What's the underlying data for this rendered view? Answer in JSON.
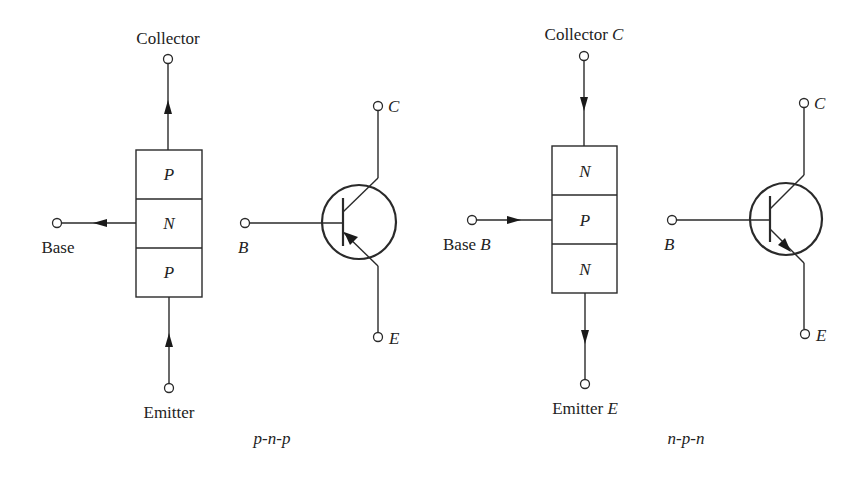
{
  "figure": {
    "pnp": {
      "caption": "p-n-p",
      "block": {
        "collector_label": "Collector",
        "base_label": "Base",
        "emitter_label": "Emitter",
        "layers": [
          "P",
          "N",
          "P"
        ]
      },
      "symbol": {
        "collector_label": "C",
        "base_label": "B",
        "emitter_label": "E"
      }
    },
    "npn": {
      "caption": "n-p-n",
      "block": {
        "collector_label": "Collector",
        "collector_symbol": "C",
        "base_label": "Base",
        "base_symbol": "B",
        "emitter_label": "Emitter",
        "emitter_symbol": "E",
        "layers": [
          "N",
          "P",
          "N"
        ]
      },
      "symbol": {
        "collector_label": "C",
        "base_label": "B",
        "emitter_label": "E"
      }
    }
  },
  "colors": {
    "line": "#2a2a2a",
    "text": "#222222",
    "background": "#ffffff"
  }
}
